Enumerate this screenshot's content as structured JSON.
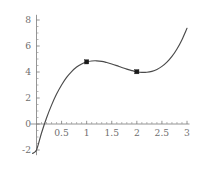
{
  "chart_data": {
    "type": "line",
    "title": "",
    "subtitle": "",
    "xlabel": "",
    "ylabel": "",
    "xlim": [
      -0.12,
      3.05
    ],
    "ylim": [
      -2.4,
      8.4
    ],
    "grid": false,
    "legend": null,
    "x_ticks": [
      0.5,
      1,
      1.5,
      2,
      2.5,
      3
    ],
    "x_tick_labels": [
      "0.5",
      "1",
      "1.5",
      "2",
      "2.5",
      "3"
    ],
    "y_ticks": [
      -2,
      0,
      2,
      4,
      6,
      8
    ],
    "y_tick_labels": [
      "-2",
      "0",
      "2",
      "4",
      "6",
      "8"
    ],
    "x_minor_ticks": [
      0.1,
      0.2,
      0.3,
      0.4,
      0.6,
      0.7,
      0.8,
      0.9,
      1.1,
      1.2,
      1.3,
      1.4,
      1.6,
      1.7,
      1.8,
      1.9,
      2.1,
      2.2,
      2.3,
      2.4,
      2.6,
      2.7,
      2.8,
      2.9
    ],
    "y_minor_ticks": [
      -1.5,
      -1,
      -0.5,
      0.5,
      1,
      1.5,
      2.5,
      3,
      3.5,
      4.5,
      5,
      5.5,
      6.5,
      7,
      7.5
    ],
    "series": [
      {
        "name": "curve",
        "type": "line",
        "color": "#4a4a4a",
        "x": [
          -0.08,
          0.0,
          0.1,
          0.2,
          0.3,
          0.4,
          0.5,
          0.6,
          0.7,
          0.8,
          0.9,
          1.0,
          1.1,
          1.2,
          1.3,
          1.4,
          1.5,
          1.6,
          1.7,
          1.8,
          1.9,
          2.0,
          2.1,
          2.2,
          2.3,
          2.4,
          2.5,
          2.6,
          2.7,
          2.8,
          2.9,
          3.0
        ],
        "y": [
          -2.26,
          -2.0,
          -0.69,
          0.46,
          1.45,
          2.3,
          3.0,
          3.58,
          4.03,
          4.38,
          4.62,
          4.78,
          4.85,
          4.86,
          4.82,
          4.73,
          4.62,
          4.49,
          4.35,
          4.22,
          4.11,
          4.02,
          3.97,
          3.98,
          4.05,
          4.19,
          4.43,
          4.76,
          5.2,
          5.77,
          6.49,
          7.36
        ]
      }
    ],
    "points": [
      {
        "label": "local maximum",
        "x": 1,
        "y": 4.78,
        "marker": "square",
        "color": "#1a1a1a"
      },
      {
        "label": "local minimum",
        "x": 2,
        "y": 4.02,
        "marker": "square",
        "color": "#1a1a1a"
      }
    ],
    "axis_color": "#7a7a7a",
    "tick_label_color": "#6f6f6f",
    "background": "#ffffff"
  }
}
